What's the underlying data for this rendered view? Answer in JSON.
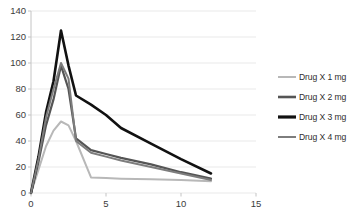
{
  "chart_data": {
    "type": "line",
    "title": "",
    "subtitle": "",
    "xlabel": "",
    "ylabel": "",
    "xlim": [
      0,
      15
    ],
    "ylim": [
      0,
      140
    ],
    "xticks": [
      0,
      5,
      10,
      15
    ],
    "yticks": [
      0,
      20,
      40,
      60,
      80,
      100,
      120,
      140
    ],
    "xtick_labels": [
      "0",
      "5",
      "10",
      "15"
    ],
    "ytick_labels": [
      "0",
      "20",
      "40",
      "60",
      "80",
      "100",
      "120",
      "140"
    ],
    "grid": "horizontal",
    "legend_position": "right",
    "x": [
      0,
      0.5,
      1,
      1.5,
      2,
      2.5,
      3,
      4,
      5,
      6,
      8,
      10,
      12
    ],
    "series": [
      {
        "name": "Drug X 1 mg",
        "color": "#b8b8b8",
        "width": 2.0,
        "values": [
          0,
          18,
          36,
          48,
          55,
          52,
          40,
          12,
          11.5,
          11,
          10.5,
          10,
          9
        ]
      },
      {
        "name": "Drug X 2 mg",
        "color": "#555555",
        "width": 2.2,
        "values": [
          0,
          24,
          52,
          72,
          98,
          80,
          42,
          33,
          30,
          27,
          22,
          16,
          11
        ]
      },
      {
        "name": "Drug X 3 mg",
        "color": "#111111",
        "width": 2.6,
        "values": [
          0,
          28,
          62,
          86,
          125,
          98,
          75,
          68,
          60,
          50,
          38,
          26,
          15
        ]
      },
      {
        "name": "Drug X 4 mg",
        "color": "#7d7d7d",
        "width": 2.0,
        "values": [
          0,
          26,
          58,
          80,
          100,
          88,
          40,
          31,
          28,
          25,
          20,
          15,
          10
        ]
      }
    ]
  },
  "legend": {
    "items": [
      {
        "label": "Drug X 1 mg",
        "color": "#b8b8b8",
        "width": 2.0
      },
      {
        "label": "Drug X 2 mg",
        "color": "#555555",
        "width": 2.6
      },
      {
        "label": "Drug X 3 mg",
        "color": "#111111",
        "width": 3.2
      },
      {
        "label": "Drug X 4 mg",
        "color": "#7d7d7d",
        "width": 2.0
      }
    ]
  },
  "axes": {
    "y_labels": [
      "140",
      "120",
      "100",
      "80",
      "60",
      "40",
      "20",
      "0"
    ],
    "x_labels": [
      "0",
      "5",
      "10",
      "15"
    ]
  },
  "colors": {
    "gridline": "#e9e9e9",
    "axis": "#c4c4c4",
    "tick_text": "#3b3b3b",
    "background": "#ffffff"
  }
}
